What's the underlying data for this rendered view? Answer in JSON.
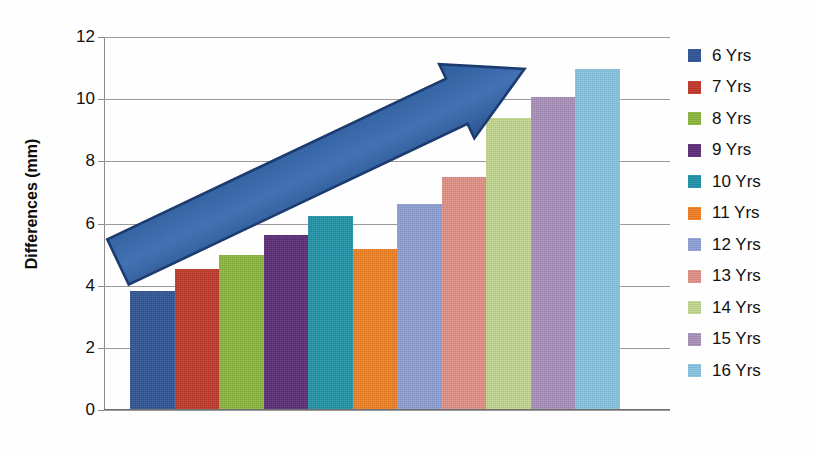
{
  "chart_data": {
    "type": "bar",
    "title": "",
    "xlabel": "",
    "ylabel": "Differences (mm)",
    "ylim": [
      0,
      12
    ],
    "ytick_values": [
      12,
      10,
      8,
      6,
      4,
      2,
      0
    ],
    "ytick_labels": [
      "12",
      "10",
      "8",
      "6",
      "4",
      "2",
      "0"
    ],
    "grid": true,
    "legend_position": "right",
    "xtick_labels": [],
    "categories": [
      "6 Yrs",
      "7 Yrs",
      "8 Yrs",
      "9 Yrs",
      "10 Yrs",
      "11 Yrs",
      "12 Yrs",
      "13 Yrs",
      "14 Yrs",
      "15 Yrs",
      "16 Yrs"
    ],
    "values": [
      3.8,
      4.5,
      4.95,
      5.6,
      6.2,
      5.15,
      6.6,
      7.45,
      9.35,
      10.05,
      10.95
    ],
    "colors": [
      "#2f5597",
      "#c0392b",
      "#8bb63c",
      "#5c2d78",
      "#2092a8",
      "#ef8023",
      "#8d9fd4",
      "#e09085",
      "#c2d68f",
      "#a890bb",
      "#88c3e0"
    ],
    "series": [
      {
        "name": "Differences",
        "points": [
          {
            "label": "6 Yrs",
            "value": 3.8,
            "color": "#2f5597"
          },
          {
            "label": "7 Yrs",
            "value": 4.5,
            "color": "#c0392b"
          },
          {
            "label": "8 Yrs",
            "value": 4.95,
            "color": "#8bb63c"
          },
          {
            "label": "9 Yrs",
            "value": 5.6,
            "color": "#5c2d78"
          },
          {
            "label": "10 Yrs",
            "value": 6.2,
            "color": "#2092a8"
          },
          {
            "label": "11 Yrs",
            "value": 5.15,
            "color": "#ef8023"
          },
          {
            "label": "12 Yrs",
            "value": 6.6,
            "color": "#8d9fd4"
          },
          {
            "label": "13 Yrs",
            "value": 7.45,
            "color": "#e09085"
          },
          {
            "label": "14 Yrs",
            "value": 9.35,
            "color": "#c2d68f"
          },
          {
            "label": "15 Yrs",
            "value": 10.05,
            "color": "#a890bb"
          },
          {
            "label": "16 Yrs",
            "value": 10.95,
            "color": "#88c3e0"
          }
        ]
      }
    ],
    "annotations": [
      {
        "type": "arrow",
        "name": "upward-trend-arrow",
        "color": "#3c6aad",
        "outline_color": "#1f3f73",
        "from": [
          118,
          262
        ],
        "to": [
          568,
          48
        ]
      }
    ]
  },
  "legend": {
    "items": [
      {
        "label": "6 Yrs",
        "color": "#2f5597"
      },
      {
        "label": "7 Yrs",
        "color": "#c0392b"
      },
      {
        "label": "8 Yrs",
        "color": "#8bb63c"
      },
      {
        "label": "9 Yrs",
        "color": "#5c2d78"
      },
      {
        "label": "10 Yrs",
        "color": "#2092a8"
      },
      {
        "label": "11 Yrs",
        "color": "#ef8023"
      },
      {
        "label": "12 Yrs",
        "color": "#8d9fd4"
      },
      {
        "label": "13 Yrs",
        "color": "#e09085"
      },
      {
        "label": "14 Yrs",
        "color": "#c2d68f"
      },
      {
        "label": "15 Yrs",
        "color": "#a890bb"
      },
      {
        "label": "16 Yrs",
        "color": "#88c3e0"
      }
    ]
  }
}
